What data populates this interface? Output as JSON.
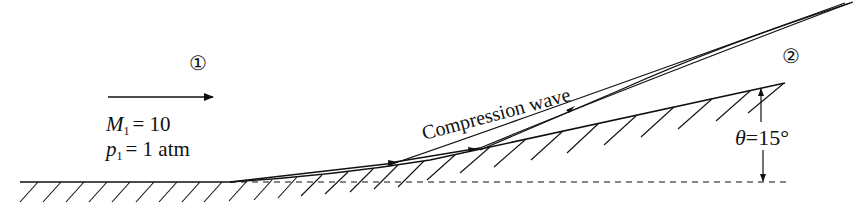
{
  "diagram": {
    "type": "compression-corner-flow",
    "regions": [
      {
        "id": "region-1",
        "label": "①",
        "x": 200,
        "y": 70
      },
      {
        "id": "region-2",
        "label": "②",
        "x": 793,
        "y": 64
      }
    ],
    "freestream": {
      "mach_symbol": "M",
      "mach_subscript": "1",
      "mach_value": "= 10",
      "pressure_symbol": "p",
      "pressure_subscript": "1",
      "pressure_value": "= 1 atm"
    },
    "wave_label": "Compression wave",
    "angle": {
      "symbol": "θ",
      "value": "=15°"
    }
  }
}
